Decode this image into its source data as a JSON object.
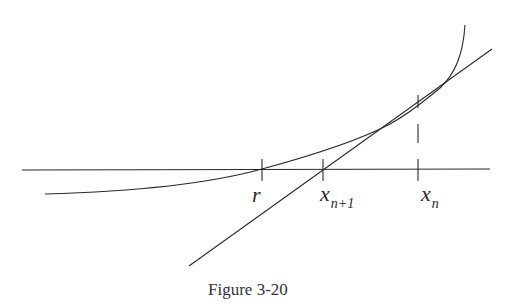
{
  "figure": {
    "caption": "Figure 3-20",
    "labels": {
      "root": "r",
      "next_x": "x",
      "next_sub": "n+1",
      "current_x": "x",
      "current_sub": "n"
    },
    "colors": {
      "line": "#2a2a2a",
      "background": "#ffffff"
    }
  }
}
